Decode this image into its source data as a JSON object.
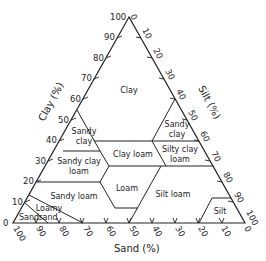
{
  "axes": {
    "clay": {
      "title": "Clay (%)",
      "ticks": [
        "0",
        "10",
        "20",
        "30",
        "40",
        "50",
        "60",
        "70",
        "80",
        "90",
        "100"
      ]
    },
    "silt": {
      "title": "Silt (%)",
      "ticks": [
        "0",
        "10",
        "20",
        "30",
        "40",
        "50",
        "60",
        "70",
        "80",
        "90",
        "100"
      ]
    },
    "sand": {
      "title": "Sand (%)",
      "ticks": [
        "100",
        "90",
        "80",
        "70",
        "60",
        "50",
        "40",
        "30",
        "20",
        "10",
        "0"
      ]
    }
  },
  "classes": [
    {
      "id": "clay",
      "lines": [
        "Clay"
      ]
    },
    {
      "id": "sandy-clay-left",
      "lines": [
        "Sandy",
        "clay"
      ]
    },
    {
      "id": "sandy-clay-right",
      "lines": [
        "Sandy",
        "clay"
      ]
    },
    {
      "id": "sandy-clay-loam",
      "lines": [
        "Sandy clay",
        "loam"
      ]
    },
    {
      "id": "clay-loam",
      "lines": [
        "Clay loam"
      ]
    },
    {
      "id": "silty-clay-loam",
      "lines": [
        "Silty clay",
        "loam"
      ]
    },
    {
      "id": "loam",
      "lines": [
        "Loam"
      ]
    },
    {
      "id": "sandy-loam",
      "lines": [
        "Sandy loam"
      ]
    },
    {
      "id": "silt-loam",
      "lines": [
        "Silt loam"
      ]
    },
    {
      "id": "silt",
      "lines": [
        "Silt"
      ]
    },
    {
      "id": "loamy-sand",
      "lines": [
        "Loamy",
        "sand"
      ]
    },
    {
      "id": "sand",
      "lines": [
        "Sand"
      ]
    }
  ],
  "colors": {
    "line": "#222222",
    "background": "#ffffff"
  }
}
